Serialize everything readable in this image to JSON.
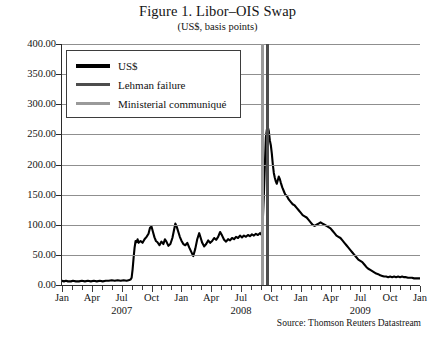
{
  "title": "Figure 1. Libor–OIS Swap",
  "subtitle": "(US$, basis points)",
  "source": "Source: Thomson Reuters Datastream",
  "legend": {
    "items": [
      {
        "label": "US$",
        "color": "#000000"
      },
      {
        "label": "Lehman failure",
        "color": "#4d4d4d"
      },
      {
        "label": "Ministerial communiqué",
        "color": "#9a9a9a"
      }
    ]
  },
  "chart_data": {
    "type": "line",
    "title": "Figure 1. Libor–OIS Swap",
    "subtitle": "(US$, basis points)",
    "xlabel": "",
    "ylabel": "",
    "ylim": [
      0,
      400
    ],
    "ytick_step": 50,
    "ytick_labels": [
      "400.00",
      "350.00",
      "300.00",
      "250.00",
      "200.00",
      "150.00",
      "100.00",
      "50.00",
      "0.00"
    ],
    "ytick_values": [
      400,
      350,
      300,
      250,
      200,
      150,
      100,
      50,
      0
    ],
    "grid": true,
    "legend_position": "top-left",
    "xtick_labels": [
      "Jan",
      "Apr",
      "Jul",
      "Oct",
      "Jan",
      "Apr",
      "Jul",
      "Oct",
      "Jan",
      "Apr",
      "Jul",
      "Oct",
      "Jan"
    ],
    "xtick_months": [
      0,
      3,
      6,
      9,
      12,
      15,
      18,
      21,
      24,
      27,
      30,
      33,
      36
    ],
    "year_labels": [
      {
        "label": "2007",
        "month_index": 6
      },
      {
        "label": "2008",
        "month_index": 18
      },
      {
        "label": "2009",
        "month_index": 30
      }
    ],
    "xlim_months": [
      0,
      36
    ],
    "x_start": "2007-01",
    "x_end": "2010-01",
    "annotations": [
      {
        "name": "Ministerial communiqué",
        "month_index": 20.1,
        "color": "#9a9a9a"
      },
      {
        "name": "Lehman failure",
        "month_index": 20.6,
        "color": "#4d4d4d"
      }
    ],
    "series": [
      {
        "name": "US$",
        "color": "#000000",
        "points": [
          [
            0.0,
            7
          ],
          [
            0.2,
            6
          ],
          [
            0.4,
            7
          ],
          [
            0.6,
            6
          ],
          [
            0.9,
            6
          ],
          [
            1.1,
            7
          ],
          [
            1.4,
            6
          ],
          [
            1.7,
            6
          ],
          [
            2.0,
            7
          ],
          [
            2.3,
            6
          ],
          [
            2.6,
            7
          ],
          [
            2.9,
            6
          ],
          [
            3.2,
            7
          ],
          [
            3.5,
            6
          ],
          [
            3.8,
            7
          ],
          [
            4.1,
            6
          ],
          [
            4.4,
            7
          ],
          [
            4.7,
            7
          ],
          [
            5.0,
            8
          ],
          [
            5.3,
            7
          ],
          [
            5.6,
            8
          ],
          [
            5.9,
            7
          ],
          [
            6.2,
            8
          ],
          [
            6.5,
            7
          ],
          [
            6.7,
            8
          ],
          [
            6.9,
            9
          ],
          [
            7.0,
            12
          ],
          [
            7.1,
            26
          ],
          [
            7.2,
            45
          ],
          [
            7.3,
            62
          ],
          [
            7.4,
            73
          ],
          [
            7.5,
            71
          ],
          [
            7.6,
            76
          ],
          [
            7.7,
            70
          ],
          [
            7.9,
            73
          ],
          [
            8.1,
            70
          ],
          [
            8.3,
            76
          ],
          [
            8.5,
            80
          ],
          [
            8.7,
            85
          ],
          [
            8.85,
            95
          ],
          [
            9.0,
            97
          ],
          [
            9.15,
            88
          ],
          [
            9.3,
            79
          ],
          [
            9.45,
            73
          ],
          [
            9.6,
            71
          ],
          [
            9.8,
            66
          ],
          [
            10.0,
            72
          ],
          [
            10.2,
            68
          ],
          [
            10.35,
            76
          ],
          [
            10.5,
            72
          ],
          [
            10.7,
            65
          ],
          [
            10.9,
            68
          ],
          [
            11.1,
            78
          ],
          [
            11.25,
            90
          ],
          [
            11.4,
            102
          ],
          [
            11.55,
            96
          ],
          [
            11.7,
            88
          ],
          [
            11.85,
            80
          ],
          [
            12.0,
            74
          ],
          [
            12.2,
            68
          ],
          [
            12.4,
            66
          ],
          [
            12.6,
            70
          ],
          [
            12.8,
            62
          ],
          [
            13.0,
            55
          ],
          [
            13.2,
            48
          ],
          [
            13.4,
            60
          ],
          [
            13.6,
            76
          ],
          [
            13.8,
            86
          ],
          [
            13.95,
            78
          ],
          [
            14.1,
            70
          ],
          [
            14.3,
            64
          ],
          [
            14.5,
            68
          ],
          [
            14.7,
            74
          ],
          [
            14.9,
            70
          ],
          [
            15.1,
            73
          ],
          [
            15.3,
            78
          ],
          [
            15.5,
            75
          ],
          [
            15.7,
            80
          ],
          [
            15.9,
            88
          ],
          [
            16.1,
            82
          ],
          [
            16.3,
            75
          ],
          [
            16.5,
            72
          ],
          [
            16.7,
            76
          ],
          [
            16.9,
            74
          ],
          [
            17.1,
            78
          ],
          [
            17.3,
            76
          ],
          [
            17.5,
            80
          ],
          [
            17.7,
            78
          ],
          [
            17.9,
            82
          ],
          [
            18.1,
            79
          ],
          [
            18.3,
            82
          ],
          [
            18.5,
            80
          ],
          [
            18.7,
            83
          ],
          [
            18.9,
            81
          ],
          [
            19.1,
            84
          ],
          [
            19.3,
            82
          ],
          [
            19.5,
            85
          ],
          [
            19.7,
            83
          ],
          [
            19.9,
            86
          ],
          [
            20.0,
            84
          ],
          [
            20.1,
            88
          ],
          [
            20.2,
            110
          ],
          [
            20.3,
            150
          ],
          [
            20.4,
            200
          ],
          [
            20.5,
            245
          ],
          [
            20.6,
            258
          ],
          [
            20.7,
            262
          ],
          [
            20.8,
            255
          ],
          [
            20.9,
            240
          ],
          [
            21.0,
            232
          ],
          [
            21.1,
            218
          ],
          [
            21.2,
            200
          ],
          [
            21.3,
            186
          ],
          [
            21.4,
            178
          ],
          [
            21.5,
            172
          ],
          [
            21.6,
            168
          ],
          [
            21.7,
            174
          ],
          [
            21.8,
            180
          ],
          [
            21.9,
            176
          ],
          [
            22.0,
            170
          ],
          [
            22.15,
            162
          ],
          [
            22.3,
            156
          ],
          [
            22.45,
            150
          ],
          [
            22.6,
            148
          ],
          [
            22.8,
            142
          ],
          [
            23.0,
            138
          ],
          [
            23.2,
            134
          ],
          [
            23.4,
            132
          ],
          [
            23.6,
            128
          ],
          [
            23.8,
            124
          ],
          [
            24.0,
            120
          ],
          [
            24.2,
            116
          ],
          [
            24.4,
            114
          ],
          [
            24.6,
            112
          ],
          [
            24.8,
            108
          ],
          [
            25.0,
            104
          ],
          [
            25.2,
            100
          ],
          [
            25.4,
            98
          ],
          [
            25.6,
            100
          ],
          [
            25.8,
            102
          ],
          [
            26.0,
            104
          ],
          [
            26.2,
            102
          ],
          [
            26.4,
            100
          ],
          [
            26.6,
            98
          ],
          [
            26.8,
            96
          ],
          [
            27.0,
            94
          ],
          [
            27.2,
            90
          ],
          [
            27.4,
            86
          ],
          [
            27.6,
            82
          ],
          [
            27.8,
            80
          ],
          [
            28.0,
            78
          ],
          [
            28.2,
            74
          ],
          [
            28.4,
            70
          ],
          [
            28.6,
            66
          ],
          [
            28.8,
            62
          ],
          [
            29.0,
            58
          ],
          [
            29.2,
            54
          ],
          [
            29.4,
            50
          ],
          [
            29.6,
            46
          ],
          [
            29.8,
            42
          ],
          [
            30.0,
            40
          ],
          [
            30.2,
            38
          ],
          [
            30.4,
            34
          ],
          [
            30.6,
            30
          ],
          [
            30.8,
            27
          ],
          [
            31.0,
            25
          ],
          [
            31.2,
            23
          ],
          [
            31.4,
            21
          ],
          [
            31.6,
            19
          ],
          [
            31.8,
            18
          ],
          [
            32.0,
            16
          ],
          [
            32.2,
            15
          ],
          [
            32.4,
            14
          ],
          [
            32.6,
            14
          ],
          [
            32.8,
            13
          ],
          [
            33.0,
            14
          ],
          [
            33.2,
            13
          ],
          [
            33.4,
            14
          ],
          [
            33.6,
            13
          ],
          [
            33.8,
            14
          ],
          [
            34.0,
            13
          ],
          [
            34.2,
            14
          ],
          [
            34.4,
            13
          ],
          [
            34.6,
            13
          ],
          [
            34.8,
            12
          ],
          [
            35.0,
            12
          ],
          [
            35.2,
            12
          ],
          [
            35.4,
            11
          ],
          [
            35.6,
            11
          ],
          [
            35.8,
            11
          ],
          [
            36.0,
            11
          ]
        ]
      }
    ]
  }
}
